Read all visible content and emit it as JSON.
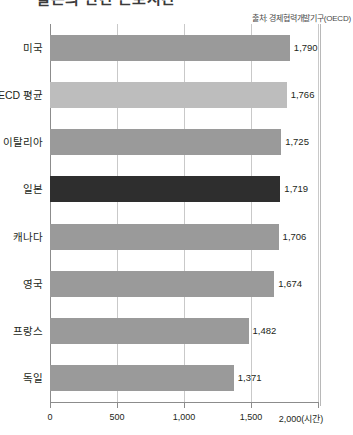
{
  "title": "일본의 연간 근로시간",
  "source_note": "출처: 경제협력개발기구(OECD)",
  "chart_data": {
    "type": "bar",
    "orientation": "horizontal",
    "title": "일본의 연간 근로시간",
    "xlabel": "2,000(시간)",
    "ylabel": "",
    "xlim": [
      0,
      2000
    ],
    "grid": true,
    "legend": "none",
    "unit": "시간",
    "source": "출처: 경제협력개발기구(OECD)",
    "xticks": [
      "0",
      "500",
      "1,000",
      "1,500",
      "2,000(시간)"
    ],
    "xtick_values": [
      0,
      500,
      1000,
      1500,
      2000
    ],
    "categories": [
      "미국",
      "OECD 평균",
      "이탈리아",
      "일본",
      "캐나다",
      "영국",
      "프랑스",
      "독일"
    ],
    "values": [
      1790,
      1766,
      1725,
      1719,
      1706,
      1674,
      1482,
      1371
    ],
    "value_labels": [
      "1,790",
      "1,766",
      "1,725",
      "1,719",
      "1,706",
      "1,674",
      "1,482",
      "1,371"
    ],
    "highlight_index": 3,
    "colors": {
      "bar_default": "#9a9a9a",
      "bar_average": "#bdbdbd",
      "bar_highlight": "#2e2e2e",
      "gridline": "#c9c9c9",
      "axis": "#8c8c8c",
      "text": "#231f20"
    },
    "bar_styles": [
      "default",
      "average",
      "default",
      "highlight",
      "default",
      "default",
      "default",
      "default"
    ]
  }
}
